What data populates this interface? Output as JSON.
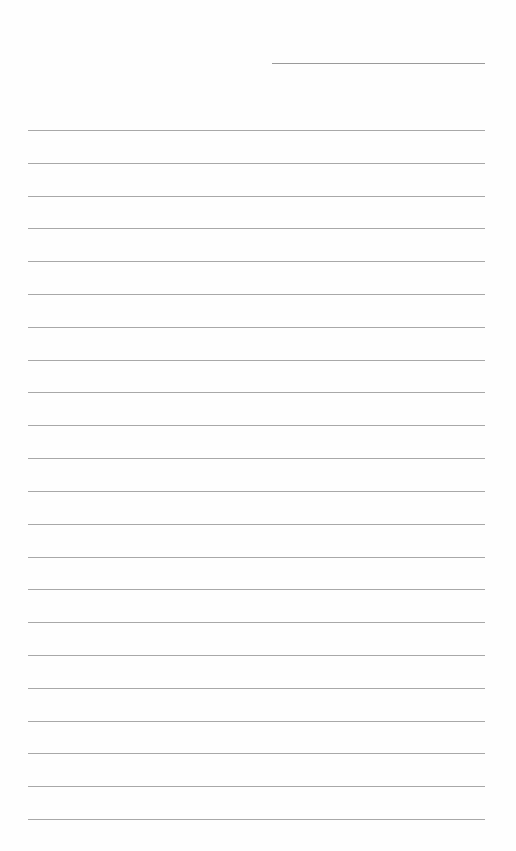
{
  "document": {
    "type": "lined-paper",
    "header_line": {
      "label": ""
    },
    "lines": [
      {
        "text": ""
      },
      {
        "text": ""
      },
      {
        "text": ""
      },
      {
        "text": ""
      },
      {
        "text": ""
      },
      {
        "text": ""
      },
      {
        "text": ""
      },
      {
        "text": ""
      },
      {
        "text": ""
      },
      {
        "text": ""
      },
      {
        "text": ""
      },
      {
        "text": ""
      },
      {
        "text": ""
      },
      {
        "text": ""
      },
      {
        "text": ""
      },
      {
        "text": ""
      },
      {
        "text": ""
      },
      {
        "text": ""
      },
      {
        "text": ""
      },
      {
        "text": ""
      },
      {
        "text": ""
      },
      {
        "text": ""
      }
    ],
    "colors": {
      "paper": "#fefefe",
      "rule": "#a8a8a8"
    }
  }
}
